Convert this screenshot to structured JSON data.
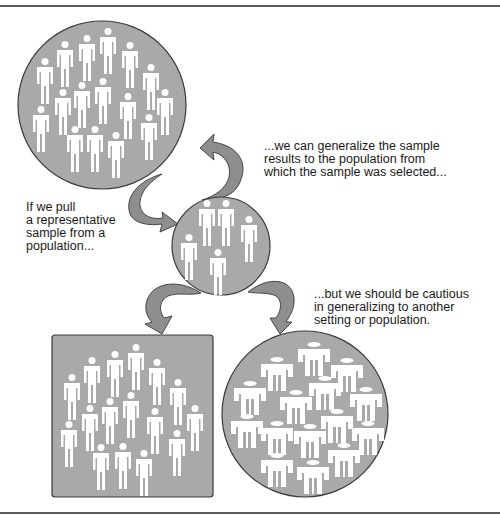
{
  "diagram": {
    "colors": {
      "shape_fill": "#a9a9a9",
      "shape_stroke": "#3a3a3a",
      "arrow_fill": "#8e8e8e",
      "figure_fill": "#ffffff",
      "text": "#1a1a1a",
      "rule": "#5a5a5a"
    },
    "nodes": [
      {
        "id": "population",
        "shape": "circle",
        "figure_count": 17,
        "figure_style": "standing-person"
      },
      {
        "id": "sample",
        "shape": "circle",
        "figure_count": 5,
        "figure_style": "standing-person"
      },
      {
        "id": "similar-population",
        "shape": "rounded-square",
        "figure_count": 17,
        "figure_style": "standing-person"
      },
      {
        "id": "different-population",
        "shape": "circle",
        "figure_count": 15,
        "figure_style": "wide-person"
      }
    ],
    "edges": [
      {
        "from": "population",
        "to": "sample"
      },
      {
        "from": "sample",
        "to": "population"
      },
      {
        "from": "sample",
        "to": "similar-population"
      },
      {
        "from": "sample",
        "to": "different-population"
      }
    ],
    "captions": {
      "generalize": "...we can generalize the sample\nresults to the population from\nwhich the sample was selected...",
      "pull_sample": "If we pull\na representative\nsample from a\npopulation...",
      "cautious": "...but we should be cautious\nin generalizing to another\nsetting or population."
    }
  }
}
